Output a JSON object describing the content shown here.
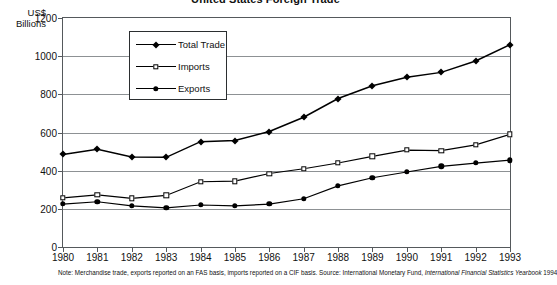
{
  "chart_data": {
    "type": "line",
    "title": "United States Foreign Trade",
    "xlabel": "",
    "ylabel": "US$ Billions",
    "ylim": [
      0,
      1200
    ],
    "ytick_step": 200,
    "grid": true,
    "legend_position": "upper-left-inside",
    "categories": [
      "1980",
      "1981",
      "1982",
      "1983",
      "1984",
      "1985",
      "1986",
      "1987",
      "1988",
      "1989",
      "1990",
      "1991",
      "1992",
      "1993"
    ],
    "series": [
      {
        "name": "Total Trade",
        "marker": "filled-diamond",
        "values": [
          485,
          512,
          472,
          470,
          552,
          558,
          605,
          680,
          778,
          845,
          890,
          915,
          975,
          1060
        ]
      },
      {
        "name": "Imports",
        "marker": "open-square",
        "values": [
          257,
          273,
          255,
          270,
          342,
          345,
          385,
          410,
          440,
          475,
          508,
          505,
          535,
          590
        ]
      },
      {
        "name": "Exports",
        "marker": "filled-circle",
        "values": [
          225,
          237,
          215,
          205,
          220,
          215,
          225,
          253,
          320,
          363,
          393,
          422,
          440,
          455
        ]
      }
    ],
    "ytick_labels": [
      "0",
      "200",
      "400",
      "600",
      "800",
      "1000",
      "1200"
    ],
    "note_prefix": "Note: Merchandise trade, exports reported on an FAS basis, imports reported on a CIF basis. Source: International Monetary Fund, ",
    "note_italic": "International Financial Statistics Yearbook",
    "note_suffix": " 1994"
  },
  "axis": {
    "unit_line1": "US$",
    "unit_line2": "Billions"
  },
  "colors": {
    "ink": "#000000",
    "frame": "#55595c",
    "grid": "#8d9194",
    "background": "#ffffff"
  }
}
